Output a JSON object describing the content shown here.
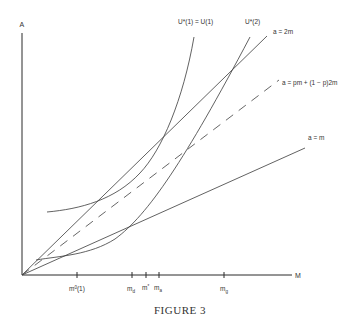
{
  "figure": {
    "caption": "FIGURE 3",
    "axes": {
      "y_label": "A",
      "x_label": "M"
    },
    "x_ticks": [
      {
        "id": "m0-1",
        "label": "m⁰(1)"
      },
      {
        "id": "m-d",
        "label": "m_d",
        "base": "m",
        "sub": "d"
      },
      {
        "id": "m-star",
        "label": "m*",
        "base": "m",
        "sup": "*"
      },
      {
        "id": "m-a",
        "label": "m_a",
        "base": "m",
        "sub": "a"
      },
      {
        "id": "m-g",
        "label": "m_g",
        "base": "m",
        "sub": "g"
      }
    ],
    "lines": [
      {
        "id": "a-2m",
        "label": "a = 2m",
        "style": "solid"
      },
      {
        "id": "a-pm",
        "label": "a = pm + (1 − p)2m",
        "style": "dashed"
      },
      {
        "id": "a-m",
        "label": "a = m",
        "style": "solid"
      }
    ],
    "curves": [
      {
        "id": "u1",
        "label": "U*(1) = U(1)"
      },
      {
        "id": "u2",
        "label": "U*(2)"
      }
    ]
  }
}
